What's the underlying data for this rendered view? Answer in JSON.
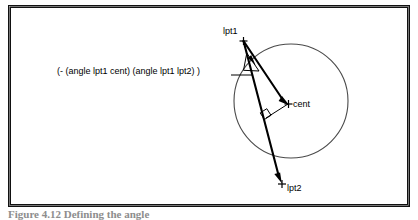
{
  "figure": {
    "background_color": "#ffffff",
    "stroke_color": "#000000",
    "frame": {
      "name": "figure-border",
      "x": 8,
      "y": 5,
      "width": 402,
      "height": 202,
      "border_width": 3
    },
    "annotation": {
      "formula": "(- (angle lpt1 cent) (angle lpt1 lpt2) )"
    },
    "labels": {
      "lpt1": "lpt1",
      "cent": "cent",
      "lpt2": "lpt2"
    },
    "caption": "Figure 4.12  Defining the angle",
    "geometry": {
      "circle": {
        "cx": 291,
        "cy": 101,
        "r": 57
      },
      "points": {
        "lpt1": {
          "x": 243,
          "y": 40
        },
        "lpt2": {
          "x": 281,
          "y": 183
        },
        "cent": {
          "x": 288,
          "y": 104
        },
        "foot": {
          "x": 266,
          "y": 118
        }
      },
      "leader_line": {
        "x1": 232,
        "y1": 75,
        "x2": 253,
        "y2": 68
      }
    }
  }
}
